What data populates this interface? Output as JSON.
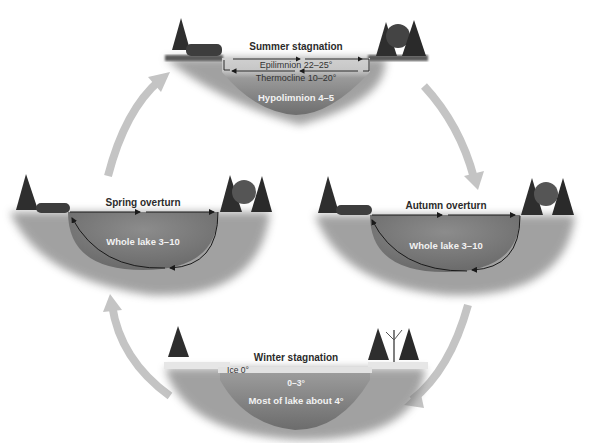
{
  "diagram": {
    "stages": {
      "summer": {
        "title": "Summer stagnation",
        "layers": {
          "epilimnion": "Epilimnion 22–25°",
          "thermocline": "Thermocline 10–20°",
          "hypolimnion": "Hypolimnion 4–5"
        }
      },
      "autumn": {
        "title": "Autumn overturn",
        "water": "Whole lake 3–10"
      },
      "winter": {
        "title": "Winter stagnation",
        "ice": "Ice 0°",
        "surface": "0–3°",
        "water": "Most of lake about 4°"
      },
      "spring": {
        "title": "Spring overturn",
        "water": "Whole lake 3–10"
      }
    },
    "cycle_order": [
      "Summer stagnation",
      "Autumn overturn",
      "Winter stagnation",
      "Spring overturn"
    ],
    "colors": {
      "background": "#ffffff",
      "cycle_arrow": "#c4c4c4",
      "water_dark": "#6e6e6e",
      "water_mid": "#8a8a8a",
      "epilimnion": "#c8c8c8",
      "ice": "#e6e6e6",
      "trees": "#2e2e2e",
      "circulation_arrow": "#1a1a1a"
    }
  }
}
